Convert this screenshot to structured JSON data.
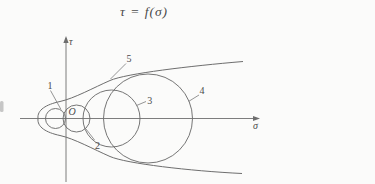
{
  "title": {
    "text": "τ = f(σ)"
  },
  "axes": {
    "tau_label": "τ",
    "sigma_label": "σ",
    "origin_label": "O",
    "tau_axis": {
      "x": 66,
      "y1": 38,
      "y2": 182
    },
    "sigma_axis": {
      "y": 118.5,
      "x1": 20,
      "x2": 258
    }
  },
  "circles": [
    {
      "id": "1",
      "cx": 55.5,
      "cy": 118.5,
      "r": 10
    },
    {
      "id": "2",
      "cx": 76.5,
      "cy": 118.5,
      "r": 13.5
    },
    {
      "id": "3",
      "cx": 111.5,
      "cy": 118.5,
      "r": 28.5
    },
    {
      "id": "4",
      "cx": 148,
      "cy": 118.5,
      "r": 44.5
    }
  ],
  "envelope": {
    "top_path": "M 38,118.5 C 37,110 46,104.5 60,101.5 S 94,87.5 110,80.5 S 190,66 243,61.5",
    "bottom_path": "M 38,118.5 C 37,127 46,132.5 60,135.5 S 94,149.5 110,156.5 S 190,171 242,173.5"
  },
  "callouts": [
    {
      "text": "1",
      "tx": 50,
      "ty": 88.5,
      "x1": 50.5,
      "y1": 90.5,
      "x2": 61,
      "y2": 109.5
    },
    {
      "text": "2",
      "tx": 97.5,
      "ty": 148.5,
      "x1": 94.5,
      "y1": 140,
      "x2": 86,
      "y2": 129
    },
    {
      "text": "3",
      "tx": 149.7,
      "ty": 103.5,
      "x1": 146,
      "y1": 101.5,
      "x2": 137,
      "y2": 105.3
    },
    {
      "text": "4",
      "tx": 202,
      "ty": 93.5,
      "x1": 199,
      "y1": 95,
      "x2": 188.5,
      "y2": 101.5
    },
    {
      "text": "5",
      "tx": 129,
      "ty": 62,
      "x1": 126,
      "y1": 63.5,
      "x2": 110.5,
      "y2": 79
    }
  ],
  "colors": {
    "line": "#6e6e6e",
    "text": "#4a4a4a",
    "background": "#fbfbfa"
  }
}
